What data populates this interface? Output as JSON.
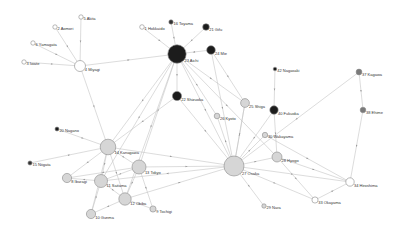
{
  "diagram": {
    "type": "network",
    "title": "",
    "colors": {
      "white": "#ffffff",
      "light": "#d6d6d6",
      "mid": "#7a7a7a",
      "dark": "#333333",
      "darkest": "#1c1c1c"
    },
    "nodes": [
      {
        "id": "1",
        "label": "1 Hokkaido",
        "x": 142,
        "y": 27,
        "r": 2.3,
        "fill": "white"
      },
      {
        "id": "2",
        "label": "2 Aomori",
        "x": 55,
        "y": 27,
        "r": 2.2,
        "fill": "white"
      },
      {
        "id": "3",
        "label": "3 Iwate",
        "x": 24,
        "y": 62,
        "r": 2.2,
        "fill": "white"
      },
      {
        "id": "4",
        "label": "4 Miyagi",
        "x": 80,
        "y": 66,
        "r": 5.5,
        "fill": "white"
      },
      {
        "id": "5",
        "label": "5 Akita",
        "x": 81,
        "y": 17,
        "r": 2.2,
        "fill": "white"
      },
      {
        "id": "6",
        "label": "6 Yamagata",
        "x": 33,
        "y": 43,
        "r": 2.2,
        "fill": "white"
      },
      {
        "id": "8",
        "label": "8 Ibaragi",
        "x": 67,
        "y": 178,
        "r": 4.6,
        "fill": "light"
      },
      {
        "id": "9",
        "label": "9 Tochigi",
        "x": 153,
        "y": 209,
        "r": 3.1,
        "fill": "light"
      },
      {
        "id": "10",
        "label": "10 Gunma",
        "x": 91,
        "y": 214,
        "r": 4.6,
        "fill": "light"
      },
      {
        "id": "11",
        "label": "11 Saitama",
        "x": 101,
        "y": 181,
        "r": 6.5,
        "fill": "light"
      },
      {
        "id": "12",
        "label": "12 Chiba",
        "x": 125,
        "y": 199,
        "r": 6.2,
        "fill": "light"
      },
      {
        "id": "13",
        "label": "13 Tokyo",
        "x": 139,
        "y": 167,
        "r": 7.0,
        "fill": "light"
      },
      {
        "id": "14",
        "label": "14 Kanagawa",
        "x": 108,
        "y": 147,
        "r": 7.8,
        "fill": "light"
      },
      {
        "id": "15",
        "label": "15 Niigata",
        "x": 30,
        "y": 163,
        "r": 2.1,
        "fill": "dark"
      },
      {
        "id": "16",
        "label": "16 Toyama",
        "x": 171,
        "y": 22,
        "r": 2.2,
        "fill": "dark"
      },
      {
        "id": "20",
        "label": "20 Nagano",
        "x": 57,
        "y": 129,
        "r": 2.0,
        "fill": "darkest"
      },
      {
        "id": "21",
        "label": "21 Gifu",
        "x": 206,
        "y": 27,
        "r": 3.3,
        "fill": "darkest"
      },
      {
        "id": "22",
        "label": "22 Shizuoka",
        "x": 177,
        "y": 96,
        "r": 4.6,
        "fill": "darkest"
      },
      {
        "id": "23",
        "label": "23 Aichi",
        "x": 177,
        "y": 54,
        "r": 9.2,
        "fill": "darkest"
      },
      {
        "id": "24",
        "label": "24 Mie",
        "x": 211,
        "y": 50,
        "r": 4.3,
        "fill": "darkest"
      },
      {
        "id": "25",
        "label": "25 Shiga",
        "x": 245,
        "y": 103,
        "r": 4.4,
        "fill": "light"
      },
      {
        "id": "26",
        "label": "26 Kyoto",
        "x": 217,
        "y": 116,
        "r": 2.8,
        "fill": "light"
      },
      {
        "id": "27",
        "label": "27 Osaka",
        "x": 234,
        "y": 166,
        "r": 10.0,
        "fill": "light"
      },
      {
        "id": "28",
        "label": "28 Hyogo",
        "x": 277,
        "y": 157,
        "r": 5.0,
        "fill": "light"
      },
      {
        "id": "29",
        "label": "29 Nara",
        "x": 264,
        "y": 206,
        "r": 2.2,
        "fill": "light"
      },
      {
        "id": "30",
        "label": "30 Wakayama",
        "x": 265,
        "y": 135,
        "r": 2.7,
        "fill": "light"
      },
      {
        "id": "33",
        "label": "33 Okayama",
        "x": 315,
        "y": 200,
        "r": 3.1,
        "fill": "white"
      },
      {
        "id": "34",
        "label": "34 Hiroshima",
        "x": 350,
        "y": 182,
        "r": 4.2,
        "fill": "white"
      },
      {
        "id": "37",
        "label": "37 Kagawa",
        "x": 359,
        "y": 72,
        "r": 2.9,
        "fill": "mid"
      },
      {
        "id": "38",
        "label": "38 Ehime",
        "x": 363,
        "y": 110,
        "r": 2.8,
        "fill": "mid"
      },
      {
        "id": "40",
        "label": "40 Fukuoka",
        "x": 274,
        "y": 110,
        "r": 4.2,
        "fill": "darkest"
      },
      {
        "id": "42",
        "label": "42 Nagasaki",
        "x": 275,
        "y": 69,
        "r": 1.8,
        "fill": "darkest"
      }
    ],
    "edges": [
      [
        "5",
        "4"
      ],
      [
        "2",
        "4"
      ],
      [
        "6",
        "4"
      ],
      [
        "3",
        "4"
      ],
      [
        "4",
        "23"
      ],
      [
        "4",
        "14"
      ],
      [
        "1",
        "23"
      ],
      [
        "16",
        "23"
      ],
      [
        "21",
        "23"
      ],
      [
        "24",
        "23"
      ],
      [
        "23",
        "14"
      ],
      [
        "23",
        "13"
      ],
      [
        "23",
        "22"
      ],
      [
        "23",
        "27"
      ],
      [
        "23",
        "26"
      ],
      [
        "23",
        "25"
      ],
      [
        "23",
        "28"
      ],
      [
        "23",
        "11"
      ],
      [
        "23",
        "12"
      ],
      [
        "24",
        "27"
      ],
      [
        "24",
        "25"
      ],
      [
        "22",
        "27"
      ],
      [
        "22",
        "14"
      ],
      [
        "42",
        "40"
      ],
      [
        "40",
        "27"
      ],
      [
        "40",
        "28"
      ],
      [
        "37",
        "38"
      ],
      [
        "37",
        "27"
      ],
      [
        "38",
        "34"
      ],
      [
        "20",
        "14"
      ],
      [
        "15",
        "14"
      ],
      [
        "14",
        "8"
      ],
      [
        "14",
        "11"
      ],
      [
        "14",
        "13"
      ],
      [
        "14",
        "12"
      ],
      [
        "14",
        "10"
      ],
      [
        "14",
        "27"
      ],
      [
        "13",
        "27"
      ],
      [
        "13",
        "11"
      ],
      [
        "13",
        "12"
      ],
      [
        "13",
        "9"
      ],
      [
        "13",
        "8"
      ],
      [
        "11",
        "8"
      ],
      [
        "11",
        "10"
      ],
      [
        "11",
        "12"
      ],
      [
        "12",
        "10"
      ],
      [
        "12",
        "27"
      ],
      [
        "9",
        "12"
      ],
      [
        "27",
        "28"
      ],
      [
        "27",
        "29"
      ],
      [
        "27",
        "30"
      ],
      [
        "27",
        "26"
      ],
      [
        "27",
        "25"
      ],
      [
        "27",
        "34"
      ],
      [
        "27",
        "33"
      ],
      [
        "27",
        "11"
      ],
      [
        "28",
        "34"
      ],
      [
        "28",
        "33"
      ],
      [
        "30",
        "34"
      ],
      [
        "33",
        "34"
      ],
      [
        "25",
        "27"
      ]
    ]
  }
}
